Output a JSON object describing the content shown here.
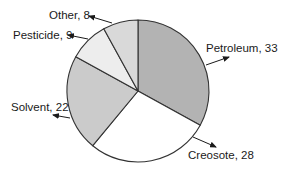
{
  "chart_data": {
    "type": "pie",
    "title": "",
    "categories": [
      "Petroleum",
      "Creosote",
      "Solvent",
      "Pesticide",
      "Other"
    ],
    "values": [
      33,
      28,
      22,
      9,
      8
    ],
    "labels": [
      "Petroleum, 33",
      "Creosote, 28",
      "Solvent, 22",
      "Pesticide, 9",
      "Other, 8"
    ],
    "colors": [
      "#b3b3b3",
      "#ffffff",
      "#cbcbcb",
      "#ededed",
      "#d9d9d9"
    ],
    "start_angle_deg": 0,
    "direction": "clockwise",
    "legend": "none",
    "label_style": "external labels with arrows"
  },
  "layout": {
    "cx": 138,
    "cy": 91,
    "r": 71,
    "stroke": "#333333",
    "callouts": [
      {
        "text_x": 206,
        "text_y": 52,
        "anchor": "start",
        "line": [
          206,
          65,
          229,
          57
        ]
      },
      {
        "text_x": 188,
        "text_y": 159,
        "anchor": "start",
        "line": [
          193,
          137,
          216,
          147
        ]
      },
      {
        "text_x": 11,
        "text_y": 111,
        "anchor": "start",
        "line": [
          70,
          118,
          53,
          115
        ]
      },
      {
        "text_x": 13,
        "text_y": 39,
        "anchor": "start",
        "line": [
          88,
          39,
          68,
          35
        ]
      },
      {
        "text_x": 49,
        "text_y": 19,
        "anchor": "start",
        "line": [
          112,
          23,
          89,
          16
        ]
      }
    ]
  }
}
